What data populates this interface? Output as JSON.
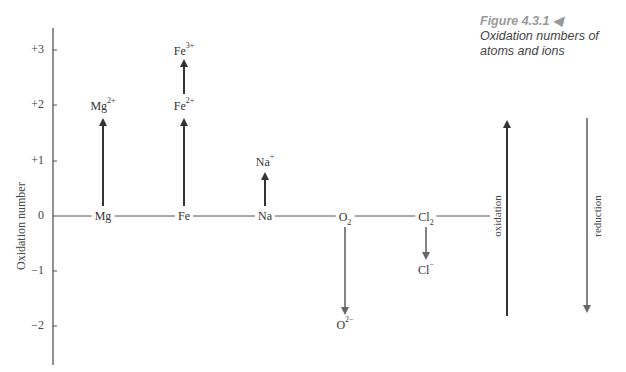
{
  "caption": {
    "figure": "Figure 4.3.1",
    "marker": "◀",
    "text": "Oxidation numbers of atoms and ions"
  },
  "axis": {
    "label": "Oxidation number",
    "ticks": [
      {
        "label": "+3",
        "value": 3
      },
      {
        "label": "+2",
        "value": 2
      },
      {
        "label": "+1",
        "value": 1
      },
      {
        "label": "0",
        "value": 0
      },
      {
        "label": "−1",
        "value": -1
      },
      {
        "label": "−2",
        "value": -2
      }
    ]
  },
  "species": {
    "mg": {
      "base": "Mg",
      "sup": "",
      "sub": ""
    },
    "mg2": {
      "base": "Mg",
      "sup": "2+",
      "sub": ""
    },
    "fe": {
      "base": "Fe",
      "sup": "",
      "sub": ""
    },
    "fe2": {
      "base": "Fe",
      "sup": "2+",
      "sub": ""
    },
    "fe3": {
      "base": "Fe",
      "sup": "3+",
      "sub": ""
    },
    "na": {
      "base": "Na",
      "sup": "",
      "sub": ""
    },
    "na1": {
      "base": "Na",
      "sup": "+",
      "sub": ""
    },
    "o2": {
      "base": "O",
      "sup": "",
      "sub": "2"
    },
    "o2m": {
      "base": "O",
      "sup": "2−",
      "sub": ""
    },
    "cl2": {
      "base": "Cl",
      "sup": "",
      "sub": "2"
    },
    "clm": {
      "base": "Cl",
      "sup": "−",
      "sub": ""
    }
  },
  "arrows": {
    "oxidation_label": "oxidation",
    "reduction_label": "reduction"
  },
  "colors": {
    "line": "#555555",
    "arrow_up": "#333333",
    "arrow_down": "#666666",
    "caption_figure": "#999999"
  }
}
